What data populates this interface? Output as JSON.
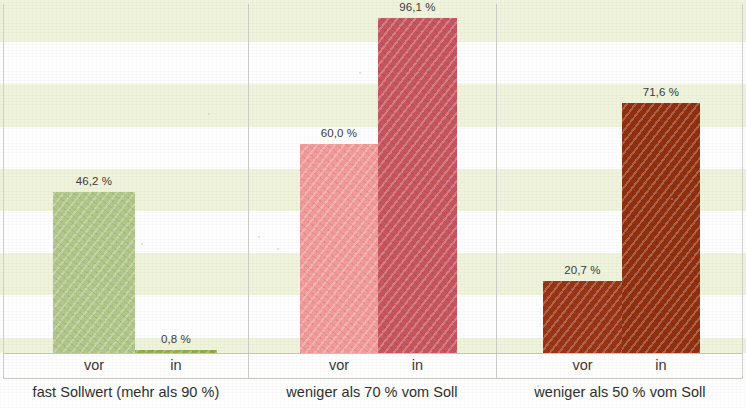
{
  "chart_data": {
    "type": "bar",
    "title": "",
    "subtitle": "",
    "xlabel": "",
    "ylabel": "",
    "ylim": [
      0,
      100
    ],
    "grid": "horizontal-alternating-bands",
    "legend": "none",
    "value_suffix": "%",
    "decimal_separator": ",",
    "categories": [
      "vor",
      "in"
    ],
    "panels": [
      {
        "caption": "fast Sollwert (mehr als 90 %)",
        "color": "#b3c98b",
        "bars": [
          {
            "category": "vor",
            "value": 46.2,
            "label": "46,2 %",
            "color": "#b3c98b"
          },
          {
            "category": "in",
            "value": 0.8,
            "label": "0,8 %",
            "color": "#93ae4a"
          }
        ]
      },
      {
        "caption": "weniger als 70 % vom Soll",
        "color": "#f09a9a",
        "bars": [
          {
            "category": "vor",
            "value": 60.0,
            "label": "60,0 %",
            "color": "#f49b9b"
          },
          {
            "category": "in",
            "value": 96.1,
            "label": "96,1 %",
            "color": "#c9565f"
          }
        ]
      },
      {
        "caption": "weniger als 50 % vom Soll",
        "color": "#9c3516",
        "bars": [
          {
            "category": "vor",
            "value": 20.7,
            "label": "20,7 %",
            "color": "#9c3516"
          },
          {
            "category": "in",
            "value": 71.6,
            "label": "71,6 %",
            "color": "#93300f"
          }
        ]
      }
    ],
    "band_color": "#f1f4dc",
    "band_alt_color": "#ffffff",
    "axis_line_color": "#c9c9c4"
  }
}
